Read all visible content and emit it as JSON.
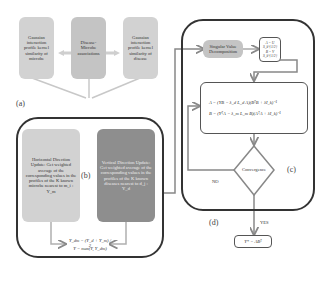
{
  "panel_a": {
    "label": "(a)",
    "boxes": [
      {
        "text": "Gaussian interaction profile kernel similarity of microbe"
      },
      {
        "text": "Disease-Microbe associations"
      },
      {
        "text": "Gaussian interaction profile kernel similarity of disease"
      }
    ]
  },
  "panel_b": {
    "label": "(b)",
    "horizontal": "Horizontal Direction Update: Get weighted average of the corresponding values in the profiles of the K known microbe nearest to m_i : Y_m",
    "vertical": "Vertical Direction Update: Get weighted average of the corresponding values in the profiles of the K known diseases nearest to d_j : Y_d",
    "formula_1": "Y_dm = (Y_d + Y_m) / 2",
    "formula_2": "Y = max(Y, Y_dm)"
  },
  "panel_c": {
    "label": "(c)",
    "svd": "Singular Value Decomposition",
    "init_1": "A = U S_k^{1/2}",
    "init_2": "B = V S_k^{1/2}",
    "update_1": "A = (YB − λ_d L_d A)(BᵀB + λI_k)⁻¹",
    "update_2": "B = (YᵀA − λ_m L_m B)(AᵀA + λI_k)⁻¹",
    "decision": "Convergence",
    "no_label": "NO",
    "yes_label": "YES"
  },
  "panel_d": {
    "label": "(d)",
    "result": "Y* = ABᵀ"
  },
  "colors": {
    "light_box": "#d2d2d2",
    "mid_box": "#c4c4c4",
    "dark_box": "#8e8e8e",
    "frame": "#333333",
    "arrow": "#9a9a9a"
  }
}
